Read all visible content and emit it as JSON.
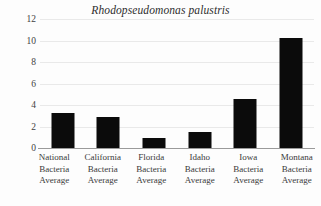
{
  "chart_data": {
    "type": "bar",
    "title": "Rhodopseudomonas palustris",
    "xlabel": "",
    "ylabel": "",
    "ylim": [
      0,
      12
    ],
    "ytick_labels": [
      "12",
      "10",
      "8",
      "6",
      "4",
      "2",
      "0"
    ],
    "yticks": [
      12,
      10,
      8,
      6,
      4,
      2,
      0
    ],
    "grid": true,
    "legend": "none",
    "bar_color": "#0b0b0b",
    "categories": [
      "National Bacteria Average",
      "California Bacteria Average",
      "Florida Bacteria Average",
      "Idaho Bacteria Average",
      "Iowa Bacteria Average",
      "Montana Bacteria Average"
    ],
    "category_lines": [
      [
        "National",
        "Bacteria",
        "Average"
      ],
      [
        "California",
        "Bacteria",
        "Average"
      ],
      [
        "Florida",
        "Bacteria",
        "Average"
      ],
      [
        "Idaho",
        "Bacteria",
        "Average"
      ],
      [
        "Iowa",
        "Bacteria",
        "Average"
      ],
      [
        "Montana",
        "Bacteria",
        "Average"
      ]
    ],
    "values": [
      3.3,
      2.9,
      0.9,
      1.5,
      4.6,
      10.2
    ]
  }
}
